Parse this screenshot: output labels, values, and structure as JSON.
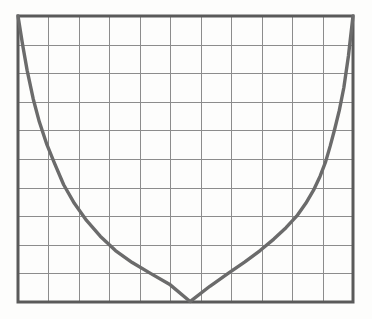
{
  "figure": {
    "title": "",
    "background_color": "#fdfdfc",
    "border_color": "#5a5a5a",
    "grid_color": "#8c8c8c",
    "curve_color": "#6b6b6b",
    "border_width": 3,
    "grid_width": 1,
    "curve_width": 3.4,
    "plot_area": {
      "left": 18,
      "top": 16,
      "right": 353,
      "bottom": 302,
      "width": 335,
      "height": 286
    }
  },
  "chart_data": {
    "type": "line",
    "title": "",
    "xlabel": "",
    "ylabel": "",
    "grid": true,
    "legend": false,
    "xlim": [
      0,
      11
    ],
    "ylim": [
      0,
      10
    ],
    "x_major_ticks": [
      0,
      1,
      2,
      3,
      4,
      5,
      6,
      7,
      8,
      9,
      10,
      11
    ],
    "y_major_ticks": [
      0,
      1,
      2,
      3,
      4,
      5,
      6,
      7,
      8,
      9,
      10
    ],
    "x_tick_labels": [
      "",
      "",
      "",
      "",
      "",
      "",
      "",
      "",
      "",
      "",
      "",
      ""
    ],
    "y_tick_labels": [
      "",
      "",
      "",
      "",
      "",
      "",
      "",
      "",
      "",
      "",
      ""
    ],
    "grid_columns": 11,
    "grid_rows": 10,
    "series": [
      {
        "name": "catenary",
        "style": "solid",
        "color": "#6b6b6b",
        "x": [
          0.0,
          0.15,
          0.3,
          0.5,
          0.7,
          0.95,
          1.2,
          1.5,
          1.85,
          2.25,
          2.7,
          3.2,
          3.75,
          4.35,
          5.0,
          5.65,
          5.66,
          6.3,
          6.9,
          7.45,
          7.95,
          8.4,
          8.8,
          9.15,
          9.45,
          9.7,
          9.92,
          10.1,
          10.25,
          10.4,
          10.55,
          10.7,
          10.85,
          11.0
        ],
        "y": [
          10.0,
          9.0,
          8.1,
          7.1,
          6.3,
          5.5,
          4.85,
          4.1,
          3.45,
          2.85,
          2.3,
          1.8,
          1.38,
          1.0,
          0.6,
          0.02,
          0.02,
          0.55,
          1.0,
          1.4,
          1.8,
          2.2,
          2.6,
          3.0,
          3.45,
          3.9,
          4.4,
          4.9,
          5.45,
          6.05,
          6.7,
          7.5,
          8.6,
          10.0
        ]
      }
    ],
    "annotations": [
      {
        "kind": "minimum",
        "x": 5.65,
        "y": 0.0,
        "note": "curve minimum touches bottom axis"
      }
    ]
  }
}
